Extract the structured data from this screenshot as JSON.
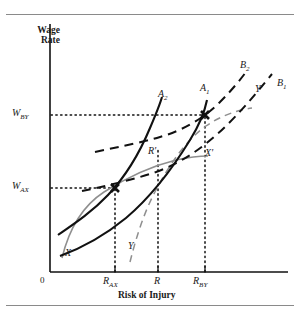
{
  "figure": {
    "type": "economics-diagram",
    "topic": "Hedonic wage-risk model: worker indifference curves and firm isoprofit curves",
    "axes": {
      "y_title": "Wage Rate",
      "x_title": "Risk of Injury",
      "origin_label": "0"
    },
    "y_ticks": [
      {
        "label": "W",
        "sub": "BY"
      },
      {
        "label": "W",
        "sub": "AX"
      }
    ],
    "x_ticks": [
      {
        "label": "R",
        "sub": "AX"
      },
      {
        "label": "R",
        "sub": ""
      },
      {
        "label": "R",
        "sub": "BY"
      }
    ],
    "curve_labels": [
      {
        "label": "A",
        "sub": "2"
      },
      {
        "label": "A",
        "sub": "1"
      },
      {
        "label": "B",
        "sub": "2"
      },
      {
        "label": "B",
        "sub": "1"
      },
      {
        "label": "X",
        "sub": ""
      },
      {
        "label": "Y",
        "sub": ""
      },
      {
        "label": "X'",
        "sub": ""
      },
      {
        "label": "Y'",
        "sub": ""
      },
      {
        "label": "R'",
        "sub": ""
      }
    ]
  },
  "chart_data": {
    "type": "line",
    "title": "",
    "xlabel": "Risk of Injury",
    "ylabel": "Wage Rate",
    "grid": false,
    "legend": "none",
    "xlim": [
      0,
      100
    ],
    "ylim": [
      0,
      100
    ],
    "annotations": [
      {
        "name": "tangency-A",
        "x": 34,
        "y": 45,
        "label": "W_AX at R_AX"
      },
      {
        "name": "tangency-B",
        "x": 71,
        "y": 76,
        "label": "W_BY at R_BY"
      }
    ],
    "series": [
      {
        "name": "A2",
        "style": "solid-black",
        "label": "A₂",
        "description": "Worker A indifference curve, higher utility",
        "points": [
          [
            4,
            13
          ],
          [
            12,
            22
          ],
          [
            22,
            33
          ],
          [
            30,
            43
          ],
          [
            36,
            54
          ],
          [
            41,
            66
          ],
          [
            44,
            77
          ],
          [
            46,
            86
          ]
        ]
      },
      {
        "name": "A1",
        "style": "solid-black",
        "label": "A₁",
        "description": "Worker A indifference curve through tangency with B1",
        "points": [
          [
            4,
            5
          ],
          [
            16,
            12
          ],
          [
            28,
            22
          ],
          [
            40,
            33
          ],
          [
            52,
            46
          ],
          [
            62,
            60
          ],
          [
            69,
            72
          ],
          [
            73,
            83
          ],
          [
            74,
            90
          ]
        ]
      },
      {
        "name": "B2",
        "style": "dashed-black",
        "label": "B₂",
        "description": "Firm isoprofit curve, lower profit",
        "points": [
          [
            19,
            57
          ],
          [
            30,
            60
          ],
          [
            42,
            64
          ],
          [
            54,
            69
          ],
          [
            64,
            76
          ],
          [
            74,
            85
          ],
          [
            83,
            95
          ]
        ]
      },
      {
        "name": "B1",
        "style": "dashed-black",
        "label": "B₁",
        "description": "Firm isoprofit curve tangent at R_BY",
        "points": [
          [
            14,
            40
          ],
          [
            28,
            43
          ],
          [
            42,
            47
          ],
          [
            55,
            53
          ],
          [
            66,
            61
          ],
          [
            77,
            73
          ],
          [
            86,
            86
          ],
          [
            92,
            95
          ]
        ]
      },
      {
        "name": "XX1",
        "style": "solid-gray",
        "label": "X - X'",
        "description": "Offer curve for worker/firm pair X",
        "points": [
          [
            8,
            5
          ],
          [
            14,
            22
          ],
          [
            22,
            38
          ],
          [
            32,
            48
          ],
          [
            44,
            54
          ],
          [
            56,
            56
          ],
          [
            68,
            56
          ],
          [
            74,
            55
          ]
        ]
      },
      {
        "name": "YY1",
        "style": "dashed-gray",
        "label": "Y - Y'",
        "description": "Offer curve for worker/firm pair Y",
        "points": [
          [
            34,
            6
          ],
          [
            38,
            20
          ],
          [
            43,
            34
          ],
          [
            49,
            48
          ],
          [
            56,
            60
          ],
          [
            64,
            72
          ],
          [
            72,
            80
          ],
          [
            82,
            84
          ],
          [
            90,
            85
          ]
        ]
      }
    ]
  }
}
